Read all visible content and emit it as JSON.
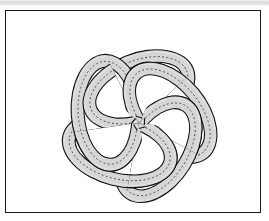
{
  "page": {
    "background_color": "#ffffff",
    "top_band_color": "#dcdcdc"
  },
  "figure": {
    "name": "interlocked-rings-link-diagram",
    "title": "",
    "frame": {
      "border_color": "#1a1a1a",
      "border_width_px": 1.6,
      "fill_color": "#ffffff",
      "x": 5,
      "y": 10,
      "width": 256,
      "height": 203
    },
    "style": {
      "band_fill_color": "#d6d6d6",
      "band_outline_color": "#111111",
      "band_highlight_color": "#ededed",
      "centerline_color": "#3a3a3a",
      "centerline_style": "dotted",
      "hole_fill_color": "#ffffff"
    },
    "geometry": {
      "component_count": 5,
      "symmetry": "5-fold rotational",
      "rotation_step_degrees": 72,
      "center_x": 134,
      "center_y": 113,
      "ring_center_offset": 33,
      "ring_semi_major_axis": 52,
      "ring_semi_minor_axis": 30,
      "band_width": 13,
      "ring_tilt_degrees": -22
    },
    "components": [
      {
        "id": "ring-1",
        "rotation_degrees": 0,
        "label": "ring 1"
      },
      {
        "id": "ring-2",
        "rotation_degrees": 72,
        "label": "ring 2"
      },
      {
        "id": "ring-3",
        "rotation_degrees": 144,
        "label": "ring 3"
      },
      {
        "id": "ring-4",
        "rotation_degrees": 216,
        "label": "ring 4"
      },
      {
        "id": "ring-5",
        "rotation_degrees": 288,
        "label": "ring 5"
      }
    ]
  }
}
